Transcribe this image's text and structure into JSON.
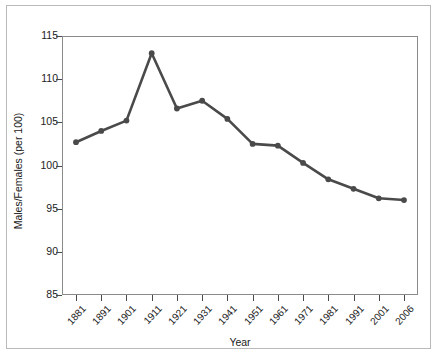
{
  "chart_data": {
    "type": "line",
    "title": "",
    "xlabel": "Year",
    "ylabel": "Males/Females (per 100)",
    "categories": [
      "1881",
      "1891",
      "1901",
      "1911",
      "1921",
      "1931",
      "1941",
      "1951",
      "1961",
      "1971",
      "1981",
      "1991",
      "2001",
      "2006"
    ],
    "values": [
      102.7,
      104.0,
      105.2,
      113.0,
      106.6,
      107.5,
      105.4,
      102.5,
      102.3,
      100.3,
      98.4,
      97.3,
      96.2,
      96.0
    ],
    "series": [
      {
        "name": "Males/Females (per 100)",
        "values": [
          102.7,
          104.0,
          105.2,
          113.0,
          106.6,
          107.5,
          105.4,
          102.5,
          102.3,
          100.3,
          98.4,
          97.3,
          96.2,
          96.0
        ]
      }
    ],
    "ylim": [
      85,
      115
    ],
    "yticks": [
      85,
      90,
      95,
      100,
      105,
      110,
      115
    ],
    "ytick_labels": [
      "85",
      "90",
      "95",
      "100",
      "105",
      "110",
      "115"
    ],
    "grid": false,
    "legend": "none",
    "line_color": "#4a4a4a",
    "marker": "circle",
    "marker_color": "#4a4a4a",
    "plot_background": "#ffffff",
    "axis_color": "#8a8a8a",
    "frame_color": "#b9b9b9"
  }
}
